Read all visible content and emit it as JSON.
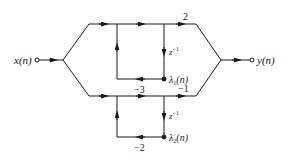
{
  "diagram": {
    "type": "signal-flow-graph",
    "input": {
      "label": "x(n)"
    },
    "output": {
      "label": "y(n)"
    },
    "branches": [
      {
        "name": "upper",
        "output_gain": "2",
        "feedback_gain": "-3",
        "delay": "z⁻¹",
        "state": "λ₁(n)"
      },
      {
        "name": "lower",
        "output_gain": "−1",
        "feedback_gain": "−2",
        "delay": "z⁻¹",
        "state": "λ₂(n)"
      }
    ],
    "labels": {
      "x": "x(n)",
      "y": "y(n)",
      "gain_top": "2",
      "gain_bottom": "−1",
      "fb_top": "−3",
      "fb_bottom": "−2",
      "delay_top": "z",
      "delay_top_exp": "−1",
      "delay_bottom": "z",
      "delay_bottom_exp": "−1",
      "lambda1_sym": "λ",
      "lambda1_sub": "1",
      "lambda1_arg": "(n)",
      "lambda2_sym": "λ",
      "lambda2_sub": "2",
      "lambda2_arg": "(n)"
    },
    "colors": {
      "line": "#1a1a1a",
      "background": "#ffffff"
    }
  }
}
